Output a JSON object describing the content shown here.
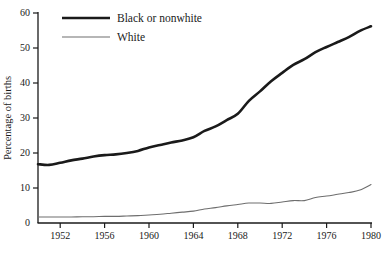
{
  "chart_data": {
    "type": "line",
    "title": "",
    "subtitle": "",
    "xlabel": "",
    "ylabel": "Percentage of births",
    "xlim": [
      1950,
      1980
    ],
    "ylim": [
      0,
      60
    ],
    "grid": false,
    "legend_position": "top-left-inside",
    "y_ticks": [
      0,
      10,
      20,
      30,
      40,
      50,
      60
    ],
    "y_tick_labels": [
      "0",
      "10",
      "20",
      "30",
      "40",
      "50",
      "60"
    ],
    "x_ticks": [
      1952,
      1956,
      1960,
      1964,
      1968,
      1972,
      1976,
      1980
    ],
    "x_tick_labels": [
      "1952",
      "1956",
      "1960",
      "1964",
      "1968",
      "1972",
      "1976",
      "1980"
    ],
    "series": [
      {
        "name": "Black or nonwhite",
        "color": "#1a1a1a",
        "line_width": 2.6,
        "x": [
          1950,
          1951,
          1952,
          1953,
          1954,
          1955,
          1956,
          1957,
          1958,
          1959,
          1960,
          1961,
          1962,
          1963,
          1964,
          1965,
          1966,
          1967,
          1968,
          1969,
          1970,
          1971,
          1972,
          1973,
          1974,
          1975,
          1976,
          1977,
          1978,
          1979,
          1980
        ],
        "values": [
          16.8,
          16.6,
          17.2,
          17.9,
          18.4,
          19.0,
          19.4,
          19.6,
          20.0,
          20.6,
          21.6,
          22.3,
          23.0,
          23.6,
          24.5,
          26.3,
          27.6,
          29.4,
          31.2,
          34.9,
          37.6,
          40.5,
          42.9,
          45.2,
          46.8,
          48.8,
          50.3,
          51.7,
          53.1,
          54.9,
          56.2
        ]
      },
      {
        "name": "White",
        "color": "#6e6e6e",
        "line_width": 1.1,
        "x": [
          1950,
          1951,
          1952,
          1953,
          1954,
          1955,
          1956,
          1957,
          1958,
          1959,
          1960,
          1961,
          1962,
          1963,
          1964,
          1965,
          1966,
          1967,
          1968,
          1969,
          1970,
          1971,
          1972,
          1973,
          1974,
          1975,
          1976,
          1977,
          1978,
          1979,
          1980
        ],
        "values": [
          1.7,
          1.7,
          1.7,
          1.7,
          1.8,
          1.8,
          1.9,
          1.9,
          2.0,
          2.1,
          2.3,
          2.5,
          2.8,
          3.1,
          3.4,
          4.0,
          4.4,
          4.9,
          5.3,
          5.7,
          5.7,
          5.6,
          6.0,
          6.4,
          6.4,
          7.3,
          7.7,
          8.2,
          8.7,
          9.4,
          11.0
        ]
      }
    ]
  },
  "legend": {
    "entries": [
      {
        "label": "Black or nonwhite",
        "color": "#1a1a1a",
        "width": 2.6
      },
      {
        "label": "White",
        "color": "#6e6e6e",
        "width": 1.1
      }
    ]
  },
  "axis": {
    "y_title": "Percentage of births"
  },
  "caption": {
    "partial_text": ""
  }
}
